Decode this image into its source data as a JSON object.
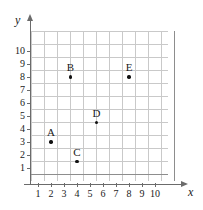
{
  "figure": {
    "type": "coordinate-plane",
    "axes": {
      "x_name": "x",
      "y_name": "y",
      "x_ticks": [
        "1",
        "2",
        "3",
        "4",
        "5",
        "6",
        "7",
        "8",
        "9",
        "10"
      ],
      "y_ticks": [
        "1",
        "2",
        "3",
        "4",
        "5",
        "6",
        "7",
        "8",
        "9",
        "10"
      ]
    },
    "points": [
      {
        "label": "A",
        "x": 2,
        "y": 3
      },
      {
        "label": "B",
        "x": 3.5,
        "y": 8
      },
      {
        "label": "C",
        "x": 4,
        "y": 1.5
      },
      {
        "label": "D",
        "x": 5.5,
        "y": 4.5
      },
      {
        "label": "E",
        "x": 8,
        "y": 8
      }
    ]
  },
  "chart_data": {
    "type": "scatter",
    "title": "",
    "xlabel": "x",
    "ylabel": "y",
    "xlim": [
      0,
      11
    ],
    "ylim": [
      0,
      11
    ],
    "grid": true,
    "legend": "none",
    "xticks": [
      1,
      2,
      3,
      4,
      5,
      6,
      7,
      8,
      9,
      10
    ],
    "yticks": [
      1,
      2,
      3,
      4,
      5,
      6,
      7,
      8,
      9,
      10
    ],
    "series": [
      {
        "name": "labeled points",
        "points": [
          {
            "label": "A",
            "x": 2,
            "y": 3
          },
          {
            "label": "B",
            "x": 3.5,
            "y": 8
          },
          {
            "label": "C",
            "x": 4,
            "y": 1.5
          },
          {
            "label": "D",
            "x": 5.5,
            "y": 4.5
          },
          {
            "label": "E",
            "x": 8,
            "y": 8
          }
        ]
      }
    ]
  },
  "colors": {
    "gridline": "#c9c9c9",
    "grid_edge": "#8d8d8d",
    "axis": "#6b6b6b",
    "point": "#111111",
    "text": "#1a1a1a",
    "background": "#ffffff"
  }
}
